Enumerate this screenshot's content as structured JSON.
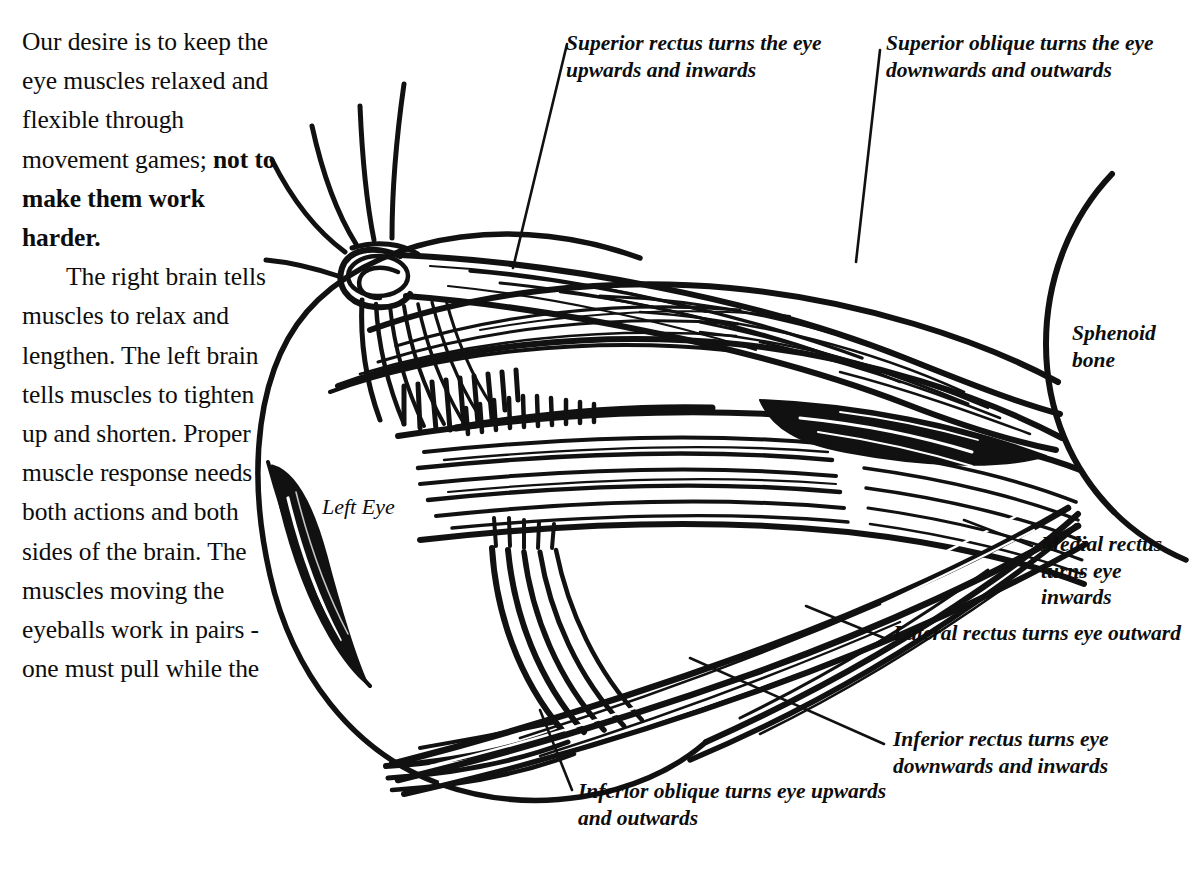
{
  "page": {
    "width": 1199,
    "height": 890,
    "background_color": "#ffffff",
    "ink_color": "#111111"
  },
  "body_text": {
    "paragraph_1_plain": "Our desire is to keep the eye muscles relaxed and flexible through movement games; ",
    "paragraph_1_bold": "not to make them work harder.",
    "paragraph_2": "The right brain tells muscles to relax and lengthen. The left brain tells muscles to tighten up and shorten. Proper muscle response needs both actions and both sides of the brain. The muscles moving the eyeballs work in pairs - one must pull while the"
  },
  "diagram": {
    "eye_label": "Left Eye",
    "labels": [
      {
        "id": "superior-rectus",
        "text": "Superior rectus turns the eye upwards and inwards",
        "muscle": "superior rectus",
        "action": "turns the eye upwards and inwards"
      },
      {
        "id": "superior-oblique",
        "text": "Superior oblique turns the eye downwards and outwards",
        "muscle": "superior oblique",
        "action": "turns the eye downwards and outwards"
      },
      {
        "id": "sphenoid-bone",
        "text": "Sphenoid bone",
        "muscle": "sphenoid bone",
        "action": ""
      },
      {
        "id": "medial-rectus",
        "text": "Medial rectus turns eye inwards",
        "muscle": "medial rectus",
        "action": "turns eye inwards"
      },
      {
        "id": "lateral-rectus",
        "text": "Lateral rectus turns eye outward",
        "muscle": "lateral rectus",
        "action": "turns eye outward"
      },
      {
        "id": "inferior-rectus",
        "text": "Inferior rectus turns eye downwards and inwards",
        "muscle": "inferior rectus",
        "action": "turns eye downwards and inwards"
      },
      {
        "id": "inferior-oblique",
        "text": "Inferior oblique turns eye upwards and outwards",
        "muscle": "inferior oblique",
        "action": "turns eye upwards and outwards"
      }
    ]
  }
}
